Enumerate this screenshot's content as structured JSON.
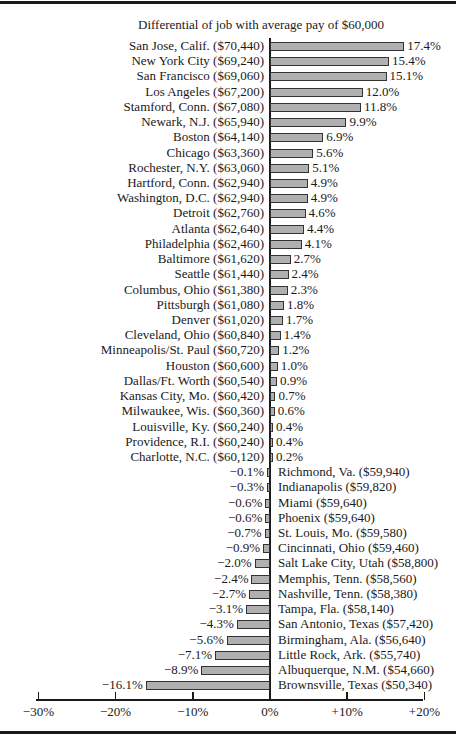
{
  "chart_data": {
    "type": "bar",
    "orientation": "horizontal",
    "title": "Differential of job with average pay of $60,000",
    "xlabel": "",
    "ylabel": "",
    "xlim": [
      -30,
      20
    ],
    "xticks": [
      "−30%",
      "−20%",
      "−10%",
      "0%",
      "+10%",
      "+20%"
    ],
    "xtick_values": [
      -30,
      -20,
      -10,
      0,
      10,
      20
    ],
    "grid": false,
    "legend": null,
    "bar_color": "#b0b0b0",
    "categories": [
      "San Jose, Calif. ($70,440)",
      "New York City ($69,240)",
      "San Francisco ($69,060)",
      "Los Angeles ($67,200)",
      "Stamford, Conn. ($67,080)",
      "Newark, N.J. ($65,940)",
      "Boston ($64,140)",
      "Chicago ($63,360)",
      "Rochester, N.Y. ($63,060)",
      "Hartford, Conn. ($62,940)",
      "Washington, D.C. ($62,940)",
      "Detroit ($62,760)",
      "Atlanta ($62,640)",
      "Philadelphia ($62,460)",
      "Baltimore ($61,620)",
      "Seattle ($61,440)",
      "Columbus, Ohio ($61,380)",
      "Pittsburgh ($61,080)",
      "Denver ($61,020)",
      "Cleveland, Ohio ($60,840)",
      "Minneapolis/St. Paul ($60,720)",
      "Houston ($60,600)",
      "Dallas/Ft. Worth ($60,540)",
      "Kansas City, Mo. ($60,420)",
      "Milwaukee, Wis. ($60,360)",
      "Louisville, Ky. ($60,240)",
      "Providence, R.I. ($60,240)",
      "Charlotte, N.C. ($60,120)",
      "Richmond, Va. ($59,940)",
      "Indianapolis ($59,820)",
      "Miami ($59,640)",
      "Phoenix ($59,640)",
      "St. Louis, Mo. ($59,580)",
      "Cincinnati, Ohio ($59,460)",
      "Salt Lake City, Utah ($58,800)",
      "Memphis, Tenn. ($58,560)",
      "Nashville, Tenn. ($58,380)",
      "Tampa, Fla. ($58,140)",
      "San Antonio, Texas ($57,420)",
      "Birmingham, Ala. ($56,640)",
      "Little Rock, Ark. ($55,740)",
      "Albuquerque, N.M. ($54,660)",
      "Brownsville, Texas ($50,340)"
    ],
    "values": [
      17.4,
      15.4,
      15.1,
      12.0,
      11.8,
      9.9,
      6.9,
      5.6,
      5.1,
      4.9,
      4.9,
      4.6,
      4.4,
      4.1,
      2.7,
      2.4,
      2.3,
      1.8,
      1.7,
      1.4,
      1.2,
      1.0,
      0.9,
      0.7,
      0.6,
      0.4,
      0.4,
      0.2,
      -0.1,
      -0.3,
      -0.6,
      -0.6,
      -0.7,
      -0.9,
      -2.0,
      -2.4,
      -2.7,
      -3.1,
      -4.3,
      -5.6,
      -7.1,
      -8.9,
      -16.1
    ],
    "value_labels": [
      "17.4%",
      "15.4%",
      "15.1%",
      "12.0%",
      "11.8%",
      "9.9%",
      "6.9%",
      "5.6%",
      "5.1%",
      "4.9%",
      "4.9%",
      "4.6%",
      "4.4%",
      "4.1%",
      "2.7%",
      "2.4%",
      "2.3%",
      "1.8%",
      "1.7%",
      "1.4%",
      "1.2%",
      "1.0%",
      "0.9%",
      "0.7%",
      "0.6%",
      "0.4%",
      "0.4%",
      "0.2%",
      "−0.1%",
      "−0.3%",
      "−0.6%",
      "−0.6%",
      "−0.7%",
      "−0.9%",
      "−2.0%",
      "−2.4%",
      "−2.7%",
      "−3.1%",
      "−4.3%",
      "−5.6%",
      "−7.1%",
      "−8.9%",
      "−16.1%"
    ]
  }
}
